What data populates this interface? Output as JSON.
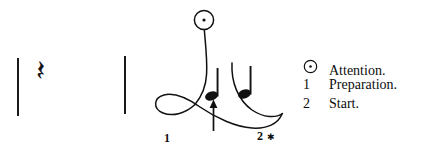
{
  "figure": {
    "kind": "music-conducting-diagram",
    "width": 431,
    "height": 156,
    "background_color": "#ffffff",
    "ink_color": "#111111"
  },
  "notation": {
    "description": "two-beat measure: quarter rest, quarter note, quarter note, between barlines",
    "barlines": [
      {
        "name": "left-barline",
        "x": 17,
        "y": 58,
        "height": 58
      },
      {
        "name": "right-barline",
        "x": 124,
        "y": 56,
        "height": 58
      }
    ],
    "rest": {
      "glyph": "𝄽",
      "icon_name": "quarter-rest-icon",
      "label": "quarter rest",
      "x": 36,
      "y": 60,
      "size": 30
    },
    "notes": [
      {
        "glyph": "♩",
        "icon_name": "quarter-note-icon",
        "label": "quarter note",
        "x": 62,
        "y": 68,
        "size": 36,
        "has_cue_arrow": true
      },
      {
        "glyph": "♩",
        "icon_name": "quarter-note-icon",
        "label": "quarter note",
        "x": 95,
        "y": 66,
        "size": 36,
        "has_cue_arrow": false
      }
    ],
    "cue_arrow": {
      "icon_name": "up-arrow-icon",
      "label": "cue arrow pointing up at beat one",
      "x": 70,
      "y_top": 96,
      "y_bottom": 130
    }
  },
  "pattern": {
    "title": "two-beat conducting pattern",
    "attention_marker": {
      "icon_name": "attention-circle-dot-icon",
      "label": "attention",
      "cx": 64,
      "cy": 20,
      "r": 9.5
    },
    "labels": [
      {
        "name": "beat-1-label",
        "text": "1",
        "x": 24,
        "y": 134
      },
      {
        "name": "beat-2-label",
        "text": "2",
        "x": 117,
        "y": 132
      }
    ],
    "star": {
      "name": "start-star-mark",
      "icon_name": "asterisk-icon",
      "text": "✱",
      "x": 127,
      "y": 134
    },
    "strokes": {
      "downbeat_stem": "from attention circle down to beat one loop",
      "loop": "counter-clockwise loop at beat one",
      "sweep": "long sweep right to beat two with upward hook",
      "inner_hook": "short inner curve of the beat two rebound"
    }
  },
  "legend": {
    "rows": [
      {
        "key": "⊙",
        "key_is_symbol": true,
        "icon_name": "attention-circle-dot-icon",
        "text": "Attention."
      },
      {
        "key": "1",
        "key_is_symbol": false,
        "icon_name": "digit-one",
        "text": "Preparation."
      },
      {
        "key": "2",
        "key_is_symbol": false,
        "icon_name": "digit-two",
        "text": "Start."
      }
    ]
  }
}
